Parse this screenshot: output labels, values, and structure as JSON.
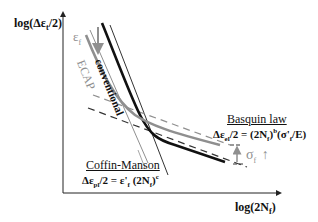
{
  "axes": {
    "y_label": "log(Δε",
    "y_label_sub": "t",
    "y_label_tail": "/2)",
    "x_label": "log(2N",
    "x_label_sub": "f",
    "x_label_tail": ")"
  },
  "curves": {
    "conventional": "conventional",
    "ecap": "ECAP"
  },
  "annotations": {
    "ef_symbol": "ε",
    "ef_sub": "f",
    "ef_arrow": "↓",
    "sigma_symbol": "σ",
    "sigma_sub": "f",
    "sigma_arrow": "↑"
  },
  "basquin": {
    "title": "Basquin law",
    "eq_lhs": "Δε",
    "eq_lhs_sub": "el",
    "eq_mid": "/2 = (2N",
    "eq_mid_sub": "f",
    "eq_mid_tail": ")",
    "eq_exp": "b",
    "eq_rhs": "(σ'",
    "eq_rhs_sub": "f",
    "eq_rhs_tail": "/E)"
  },
  "coffin": {
    "title": "Coffin-Manson",
    "eq_lhs": "Δε",
    "eq_lhs_sub": "pl",
    "eq_mid": "/2 = ε'",
    "eq_mid_sub": "f",
    "eq_rhs": " (2N",
    "eq_rhs_sub": "f",
    "eq_rhs_tail": ")",
    "eq_exp": "c"
  },
  "colors": {
    "black": "#111111",
    "gray": "#8f8f8f",
    "axis": "#222222"
  }
}
